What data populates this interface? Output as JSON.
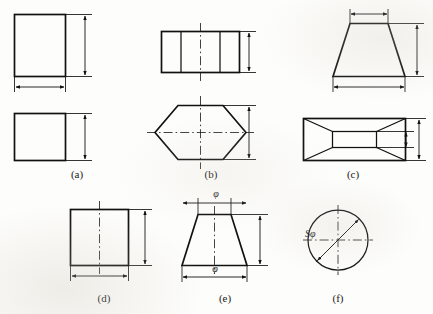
{
  "figure": {
    "kind": "engineering-dimensioning-plate",
    "background_color": "#fdfdfb",
    "line_color": "#111111",
    "panel_count": 6
  },
  "captions": [
    {
      "id": "a",
      "label": "(a)",
      "x": 77,
      "y": 168
    },
    {
      "id": "b",
      "label": "(b)",
      "x": 211,
      "y": 168
    },
    {
      "id": "c",
      "label": "(c)",
      "x": 353,
      "y": 168
    },
    {
      "id": "d",
      "label": "(d)",
      "x": 104,
      "y": 292
    },
    {
      "id": "e",
      "label": "(e)",
      "x": 225,
      "y": 292
    },
    {
      "id": "f",
      "label": "(f)",
      "x": 338,
      "y": 292
    }
  ],
  "annotations": {
    "phi_upper_e": "φ",
    "phi_lower_e": "φ",
    "sphere_diameter_f": "Sφ"
  },
  "panels": [
    {
      "id": "a",
      "name": "square-prism-two-views",
      "views": [
        "front-elevation-square",
        "top-plan-square"
      ],
      "dimensions": [
        "height-vertical",
        "width-horizontal",
        "depth-vertical"
      ]
    },
    {
      "id": "b",
      "name": "hexagonal-prism-two-views",
      "views": [
        "front-elevation-segmented-rectangle",
        "top-plan-hexagon"
      ],
      "dimensions": [
        "height-vertical",
        "across-corners-vertical"
      ]
    },
    {
      "id": "c",
      "name": "rectangular-frustum-two-views",
      "views": [
        "front-elevation-trapezoid",
        "top-plan-nested-rectangles"
      ],
      "dimensions": [
        "top-width-horizontal",
        "height-vertical",
        "base-width-horizontal",
        "inner-depth-vertical",
        "outer-depth-vertical"
      ]
    },
    {
      "id": "d",
      "name": "cylinder-front-view",
      "views": [
        "front-elevation-rectangle-with-centerline"
      ],
      "dimensions": [
        "height-vertical",
        "diameter-horizontal"
      ]
    },
    {
      "id": "e",
      "name": "cone-frustum-front-view",
      "views": [
        "front-elevation-trapezoid-with-centerline"
      ],
      "dimensions": [
        "top-diameter-phi",
        "height-vertical",
        "base-diameter-phi"
      ]
    },
    {
      "id": "f",
      "name": "sphere-single-view",
      "views": [
        "circle-with-crossed-centerlines"
      ],
      "dimensions": [
        "spherical-diameter-oblique"
      ]
    }
  ]
}
